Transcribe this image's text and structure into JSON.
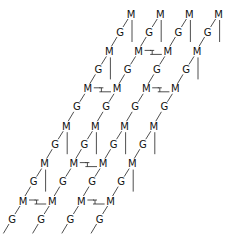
{
  "diagram": {
    "labels": {
      "metal": "M",
      "ligand": "G"
    },
    "colors": {
      "text": "#111111",
      "line": "#222222",
      "background": "#ffffff"
    },
    "rows": [
      {
        "metals": [
          "M",
          "M",
          "M",
          "M"
        ],
        "bonds": [],
        "verticals": [
          0,
          1,
          2,
          3
        ]
      },
      {
        "metals": [
          "M",
          "M",
          "M",
          "M"
        ],
        "bonds": [
          [
            1,
            2
          ]
        ],
        "verticals": [
          0,
          3
        ]
      },
      {
        "metals": [
          "M",
          "M",
          "M",
          "M"
        ],
        "bonds": [
          [
            0,
            1
          ],
          [
            2,
            3
          ]
        ],
        "verticals": []
      },
      {
        "metals": [
          "M",
          "M",
          "M",
          "M"
        ],
        "bonds": [],
        "verticals": [
          0,
          1,
          2,
          3
        ]
      },
      {
        "metals": [
          "M",
          "M",
          "M",
          "M"
        ],
        "bonds": [
          [
            1,
            2
          ]
        ],
        "verticals": [
          0,
          3
        ]
      },
      {
        "metals": [
          "M",
          "M",
          "M",
          "M"
        ],
        "bonds": [
          [
            0,
            1
          ],
          [
            2,
            3
          ]
        ],
        "verticals": []
      }
    ]
  }
}
